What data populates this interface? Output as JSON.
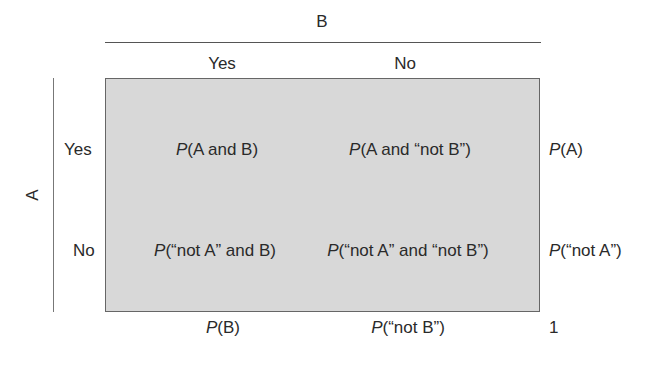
{
  "variable_b": {
    "label": "B",
    "levels": [
      "Yes",
      "No"
    ]
  },
  "variable_a": {
    "label": "A",
    "levels": [
      "Yes",
      "No"
    ]
  },
  "cells": [
    [
      {
        "p": "P",
        "text": "(A and B)"
      },
      {
        "p": "P",
        "text": "(A and “not B”)"
      }
    ],
    [
      {
        "p": "P",
        "text": "(“not A” and B)"
      },
      {
        "p": "P",
        "text": "(“not A” and “not B”)"
      }
    ]
  ],
  "row_margins": [
    {
      "p": "P",
      "text": "(A)"
    },
    {
      "p": "P",
      "text": "(“not A”)"
    }
  ],
  "col_margins": [
    {
      "p": "P",
      "text": "(B)"
    },
    {
      "p": "P",
      "text": "(“not B”)"
    }
  ],
  "total": "1",
  "colors": {
    "box_fill": "#d8d8d8",
    "border": "#666666",
    "text": "#2a2a2a"
  }
}
